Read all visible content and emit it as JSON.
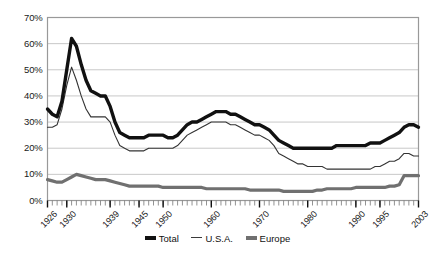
{
  "chart_data": {
    "type": "line",
    "title": "",
    "xlabel": "",
    "ylabel": "",
    "ylim": [
      0,
      70
    ],
    "ytick_labels": [
      "0%",
      "10%",
      "20%",
      "30%",
      "40%",
      "50%",
      "60%",
      "70%"
    ],
    "ytick_values": [
      0,
      10,
      20,
      30,
      40,
      50,
      60,
      70
    ],
    "xlim": [
      1926,
      2003
    ],
    "xtick_labels": [
      "1926",
      "1930",
      "1939",
      "1945",
      "1950",
      "1960",
      "1970",
      "1980",
      "1990",
      "1995",
      "2003"
    ],
    "xtick_values": [
      1926,
      1930,
      1939,
      1945,
      1950,
      1960,
      1970,
      1980,
      1990,
      1995,
      2003
    ],
    "minor_ticks": "annual",
    "grid": "horizontal",
    "legend_position": "bottom",
    "x": [
      1926,
      1927,
      1928,
      1929,
      1930,
      1931,
      1932,
      1933,
      1934,
      1935,
      1936,
      1937,
      1938,
      1939,
      1940,
      1941,
      1942,
      1943,
      1944,
      1945,
      1946,
      1947,
      1948,
      1949,
      1950,
      1951,
      1952,
      1953,
      1954,
      1955,
      1956,
      1957,
      1958,
      1959,
      1960,
      1961,
      1962,
      1963,
      1964,
      1965,
      1966,
      1967,
      1968,
      1969,
      1970,
      1971,
      1972,
      1973,
      1974,
      1975,
      1976,
      1977,
      1978,
      1979,
      1980,
      1981,
      1982,
      1983,
      1984,
      1985,
      1986,
      1987,
      1988,
      1989,
      1990,
      1991,
      1992,
      1993,
      1994,
      1995,
      1996,
      1997,
      1998,
      1999,
      2000,
      2001,
      2002,
      2003
    ],
    "series": [
      {
        "name": "Total",
        "style": "thick-black",
        "color": "#111111",
        "values": [
          35,
          33,
          32,
          38,
          50,
          62,
          59,
          52,
          46,
          42,
          41,
          40,
          40,
          36,
          30,
          26,
          25,
          24,
          24,
          24,
          24,
          25,
          25,
          25,
          25,
          24,
          24,
          25,
          27,
          29,
          30,
          30,
          31,
          32,
          33,
          34,
          34,
          34,
          33,
          33,
          32,
          31,
          30,
          29,
          29,
          28,
          27,
          25,
          23,
          22,
          21,
          20,
          20,
          20,
          20,
          20,
          20,
          20,
          20,
          20,
          21,
          21,
          21,
          21,
          21,
          21,
          21,
          22,
          22,
          22,
          23,
          24,
          25,
          26,
          28,
          29,
          29,
          28
        ]
      },
      {
        "name": "U.S.A.",
        "style": "thin-black",
        "color": "#333333",
        "values": [
          28,
          28,
          29,
          35,
          44,
          51,
          46,
          40,
          35,
          32,
          32,
          32,
          32,
          30,
          25,
          21,
          20,
          19,
          19,
          19,
          19,
          20,
          20,
          20,
          20,
          20,
          20,
          21,
          23,
          25,
          26,
          27,
          28,
          29,
          30,
          30,
          30,
          30,
          29,
          29,
          28,
          27,
          26,
          25,
          25,
          24,
          23,
          21,
          18,
          17,
          16,
          15,
          14,
          14,
          13,
          13,
          13,
          13,
          12,
          12,
          12,
          12,
          12,
          12,
          12,
          12,
          12,
          12,
          13,
          13,
          14,
          15,
          15,
          16,
          18,
          18,
          17,
          17
        ]
      },
      {
        "name": "Europe",
        "style": "thick-gray",
        "color": "#707070",
        "values": [
          8,
          7.5,
          7,
          7,
          8,
          9,
          10,
          9.5,
          9,
          8.5,
          8,
          8,
          8,
          7.5,
          7,
          6.5,
          6,
          5.5,
          5.5,
          5.5,
          5.5,
          5.5,
          5.5,
          5.5,
          5,
          5,
          5,
          5,
          5,
          5,
          5,
          5,
          5,
          4.5,
          4.5,
          4.5,
          4.5,
          4.5,
          4.5,
          4.5,
          4.5,
          4.5,
          4,
          4,
          4,
          4,
          4,
          4,
          4,
          3.5,
          3.5,
          3.5,
          3.5,
          3.5,
          3.5,
          3.5,
          4,
          4,
          4.5,
          4.5,
          4.5,
          4.5,
          4.5,
          4.5,
          5,
          5,
          5,
          5,
          5,
          5,
          5,
          5.5,
          5.5,
          6,
          9.5,
          9.5,
          9.5,
          9.5
        ]
      }
    ],
    "legend_entries": [
      "Total",
      "U.S.A.",
      "Europe"
    ],
    "colors": {
      "grid": "#c8c8c8",
      "border": "#999999",
      "axis_text": "#1a1a1a",
      "total": "#111111",
      "usa": "#333333",
      "europe": "#707070"
    }
  }
}
